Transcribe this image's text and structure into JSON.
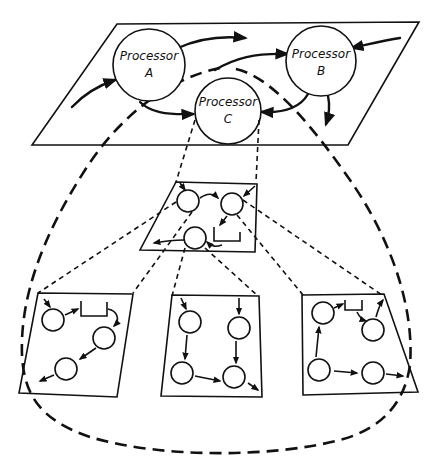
{
  "diagram": {
    "type": "hierarchical processor decomposition",
    "top_level": {
      "plane": "parallelogram",
      "processors": [
        {
          "id": "A",
          "line1": "Processor",
          "line2": "A"
        },
        {
          "id": "B",
          "line1": "Processor",
          "line2": "B"
        },
        {
          "id": "C",
          "line1": "Processor",
          "line2": "C"
        }
      ]
    },
    "middle_level": {
      "expands": "Processor C",
      "node_count": 3,
      "has_buffer_box": true
    },
    "bottom_level": {
      "panels": [
        {
          "id": "left",
          "node_count": 3,
          "has_buffer_box": true
        },
        {
          "id": "center",
          "node_count": 4,
          "has_buffer_box": false
        },
        {
          "id": "right",
          "node_count": 4,
          "has_buffer_box": true
        }
      ]
    },
    "enclosure": "dashed loop from Processor C enclosing all sub-levels"
  }
}
